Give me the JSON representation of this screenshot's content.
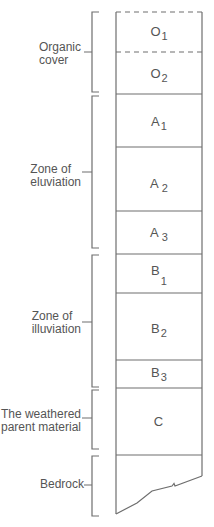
{
  "diagram": {
    "title": "",
    "colors": {
      "line": "#6e6e6e",
      "text": "#555555",
      "background": "#ffffff"
    },
    "zones": [
      {
        "label_line1": "Organic",
        "label_line2": "cover"
      },
      {
        "label_line1": "Zone of",
        "label_line2": "eluviation"
      },
      {
        "label_line1": "Zone of",
        "label_line2": "illuviation"
      },
      {
        "label_line1": "The weathered",
        "label_line2": "parent material"
      },
      {
        "label_line1": "Bedrock",
        "label_line2": ""
      }
    ],
    "horizons": [
      {
        "letter": "O",
        "sub": "1"
      },
      {
        "letter": "O",
        "sub": "2"
      },
      {
        "letter": "A",
        "sub": "1"
      },
      {
        "letter": "A",
        "sub": "2"
      },
      {
        "letter": "A",
        "sub": "3"
      },
      {
        "letter": "B",
        "sub": "1"
      },
      {
        "letter": "B",
        "sub": "2"
      },
      {
        "letter": "B",
        "sub": "3"
      },
      {
        "letter": "C",
        "sub": ""
      }
    ]
  }
}
